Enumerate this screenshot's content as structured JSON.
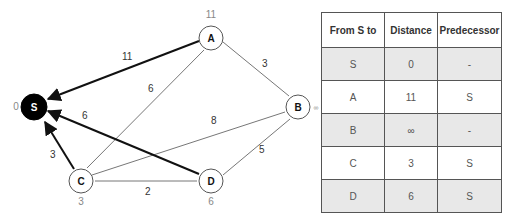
{
  "graph": {
    "nodes": [
      {
        "id": "S",
        "label": "S",
        "dist_label": "0",
        "x": 34,
        "y": 107,
        "filled": true
      },
      {
        "id": "A",
        "label": "A",
        "dist_label": "11",
        "x": 211,
        "y": 38
      },
      {
        "id": "B",
        "label": "B",
        "dist_label": "∞",
        "x": 298,
        "y": 107
      },
      {
        "id": "C",
        "label": "C",
        "dist_label": "3",
        "x": 81,
        "y": 181
      },
      {
        "id": "D",
        "label": "D",
        "dist_label": "6",
        "x": 211,
        "y": 181
      }
    ],
    "edges": [
      {
        "from": "A",
        "to": "S",
        "weight": "11",
        "bold": true
      },
      {
        "from": "C",
        "to": "A",
        "weight": "6"
      },
      {
        "from": "A",
        "to": "B",
        "weight": "3"
      },
      {
        "from": "C",
        "to": "B",
        "weight": "8"
      },
      {
        "from": "D",
        "to": "S",
        "weight": "6",
        "bold": true
      },
      {
        "from": "C",
        "to": "S",
        "weight": "3",
        "bold": true
      },
      {
        "from": "C",
        "to": "D",
        "weight": "2"
      },
      {
        "from": "D",
        "to": "B",
        "weight": "5"
      }
    ]
  },
  "table": {
    "headers": [
      "From S to",
      "Distance",
      "Predecessor"
    ],
    "rows": [
      [
        "S",
        "0",
        "-"
      ],
      [
        "A",
        "11",
        "S"
      ],
      [
        "B",
        "∞",
        "-"
      ],
      [
        "C",
        "3",
        "S"
      ],
      [
        "D",
        "6",
        "S"
      ]
    ]
  }
}
